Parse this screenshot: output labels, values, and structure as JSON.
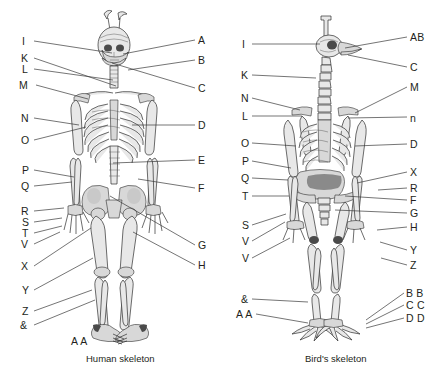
{
  "figure": {
    "title": "",
    "panels": [
      {
        "id": "human",
        "caption": "Human skeleton",
        "caption_x": 86,
        "caption_y": 353,
        "labels_left": [
          {
            "text": "I",
            "x": 22,
            "y": 36,
            "lx": 34,
            "ly": 41,
            "tx": 112,
            "ty": 53
          },
          {
            "text": "K",
            "x": 21,
            "y": 53,
            "lx": 34,
            "ly": 58,
            "tx": 116,
            "ty": 86
          },
          {
            "text": "L",
            "x": 22,
            "y": 64,
            "lx": 34,
            "ly": 69,
            "tx": 113,
            "ty": 80
          },
          {
            "text": "M",
            "x": 19,
            "y": 80,
            "lx": 36,
            "ly": 85,
            "tx": 88,
            "ty": 99
          },
          {
            "text": "N",
            "x": 21,
            "y": 113,
            "lx": 34,
            "ly": 118,
            "tx": 79,
            "ty": 125
          },
          {
            "text": "O",
            "x": 21,
            "y": 135,
            "lx": 34,
            "ly": 140,
            "tx": 86,
            "ty": 127
          },
          {
            "text": "P",
            "x": 22,
            "y": 165,
            "lx": 34,
            "ly": 170,
            "tx": 74,
            "ty": 177
          },
          {
            "text": "Q",
            "x": 21,
            "y": 181,
            "lx": 34,
            "ly": 186,
            "tx": 72,
            "ty": 182
          },
          {
            "text": "R",
            "x": 21,
            "y": 206,
            "lx": 34,
            "ly": 211,
            "tx": 64,
            "ty": 208
          },
          {
            "text": "S",
            "x": 22,
            "y": 217,
            "lx": 34,
            "ly": 222,
            "tx": 62,
            "ty": 218
          },
          {
            "text": "T",
            "x": 22,
            "y": 228,
            "lx": 34,
            "ly": 233,
            "tx": 62,
            "ty": 226
          },
          {
            "text": "V",
            "x": 21,
            "y": 239,
            "lx": 34,
            "ly": 244,
            "tx": 60,
            "ty": 232
          },
          {
            "text": "X",
            "x": 21,
            "y": 261,
            "lx": 34,
            "ly": 266,
            "tx": 91,
            "ty": 228
          },
          {
            "text": "Y",
            "x": 22,
            "y": 285,
            "lx": 34,
            "ly": 290,
            "tx": 93,
            "ty": 258
          },
          {
            "text": "Z",
            "x": 22,
            "y": 306,
            "lx": 34,
            "ly": 311,
            "tx": 92,
            "ty": 290
          },
          {
            "text": "&",
            "x": 20,
            "y": 320,
            "lx": 34,
            "ly": 325,
            "tx": 95,
            "ty": 300
          }
        ],
        "labels_right": [
          {
            "text": "A",
            "x": 198,
            "y": 35,
            "lx": 195,
            "ly": 40,
            "tx": 123,
            "ty": 54
          },
          {
            "text": "B",
            "x": 198,
            "y": 55,
            "lx": 195,
            "ly": 60,
            "tx": 128,
            "ty": 70
          },
          {
            "text": "C",
            "x": 198,
            "y": 83,
            "lx": 195,
            "ly": 88,
            "tx": 112,
            "ty": 63
          },
          {
            "text": "D",
            "x": 198,
            "y": 120,
            "lx": 195,
            "ly": 125,
            "tx": 132,
            "ty": 125
          },
          {
            "text": "E",
            "x": 198,
            "y": 155,
            "lx": 195,
            "ly": 160,
            "tx": 113,
            "ty": 163
          },
          {
            "text": "F",
            "x": 198,
            "y": 183,
            "lx": 195,
            "ly": 188,
            "tx": 138,
            "ty": 179
          },
          {
            "text": "G",
            "x": 198,
            "y": 240,
            "lx": 195,
            "ly": 245,
            "tx": 110,
            "ty": 196
          },
          {
            "text": "H",
            "x": 198,
            "y": 260,
            "lx": 195,
            "ly": 265,
            "tx": 133,
            "ty": 232
          }
        ],
        "labels_bottom": [
          {
            "text": "A A",
            "x": 71,
            "y": 336
          }
        ]
      },
      {
        "id": "bird",
        "caption": "Bird's skeleton",
        "caption_x": 305,
        "caption_y": 353,
        "labels_left": [
          {
            "text": "I",
            "x": 242,
            "y": 39,
            "lx": 252,
            "ly": 44,
            "tx": 320,
            "ty": 44
          },
          {
            "text": "K",
            "x": 241,
            "y": 70,
            "lx": 252,
            "ly": 75,
            "tx": 316,
            "ty": 78
          },
          {
            "text": "N",
            "x": 241,
            "y": 93,
            "lx": 252,
            "ly": 98,
            "tx": 300,
            "ty": 110
          },
          {
            "text": "L",
            "x": 242,
            "y": 111,
            "lx": 252,
            "ly": 116,
            "tx": 302,
            "ty": 116
          },
          {
            "text": "O",
            "x": 241,
            "y": 138,
            "lx": 252,
            "ly": 143,
            "tx": 296,
            "ty": 146
          },
          {
            "text": "P",
            "x": 242,
            "y": 156,
            "lx": 252,
            "ly": 161,
            "tx": 291,
            "ty": 168
          },
          {
            "text": "Q",
            "x": 241,
            "y": 173,
            "lx": 252,
            "ly": 178,
            "tx": 288,
            "ty": 180
          },
          {
            "text": "T",
            "x": 242,
            "y": 191,
            "lx": 252,
            "ly": 196,
            "tx": 289,
            "ty": 196
          },
          {
            "text": "S",
            "x": 242,
            "y": 220,
            "lx": 252,
            "ly": 225,
            "tx": 286,
            "ty": 214
          },
          {
            "text": "V",
            "x": 242,
            "y": 236,
            "lx": 252,
            "ly": 241,
            "tx": 285,
            "ty": 222
          },
          {
            "text": "V",
            "x": 242,
            "y": 253,
            "lx": 252,
            "ly": 258,
            "tx": 290,
            "ty": 238
          },
          {
            "text": "&",
            "x": 241,
            "y": 294,
            "lx": 252,
            "ly": 299,
            "tx": 308,
            "ty": 302
          },
          {
            "text": "A A",
            "x": 236,
            "y": 309,
            "lx": 256,
            "ly": 314,
            "tx": 308,
            "ty": 323
          }
        ],
        "labels_right": [
          {
            "text": "AB",
            "x": 410,
            "y": 32,
            "lx": 407,
            "ly": 37,
            "tx": 345,
            "ty": 48
          },
          {
            "text": "C",
            "x": 410,
            "y": 62,
            "lx": 407,
            "ly": 67,
            "tx": 348,
            "ty": 55
          },
          {
            "text": "M",
            "x": 410,
            "y": 82,
            "lx": 407,
            "ly": 87,
            "tx": 355,
            "ty": 113
          },
          {
            "text": "n",
            "x": 410,
            "y": 113,
            "lx": 407,
            "ly": 117,
            "tx": 348,
            "ty": 118
          },
          {
            "text": "D",
            "x": 410,
            "y": 139,
            "lx": 407,
            "ly": 144,
            "tx": 355,
            "ty": 146
          },
          {
            "text": "X",
            "x": 410,
            "y": 167,
            "lx": 407,
            "ly": 172,
            "tx": 357,
            "ty": 183
          },
          {
            "text": "R",
            "x": 410,
            "y": 183,
            "lx": 407,
            "ly": 188,
            "tx": 378,
            "ty": 190
          },
          {
            "text": "F",
            "x": 410,
            "y": 195,
            "lx": 407,
            "ly": 200,
            "tx": 345,
            "ty": 196
          },
          {
            "text": "G",
            "x": 410,
            "y": 208,
            "lx": 407,
            "ly": 213,
            "tx": 335,
            "ty": 210
          },
          {
            "text": "H",
            "x": 410,
            "y": 222,
            "lx": 407,
            "ly": 227,
            "tx": 377,
            "ty": 230
          },
          {
            "text": "Y",
            "x": 410,
            "y": 245,
            "lx": 407,
            "ly": 250,
            "tx": 380,
            "ty": 242
          },
          {
            "text": "Z",
            "x": 410,
            "y": 260,
            "lx": 407,
            "ly": 265,
            "tx": 381,
            "ty": 258
          },
          {
            "text": "B B",
            "x": 406,
            "y": 288,
            "lx": 404,
            "ly": 293,
            "tx": 366,
            "ty": 320
          },
          {
            "text": "C C",
            "x": 406,
            "y": 300,
            "lx": 404,
            "ly": 305,
            "tx": 366,
            "ty": 324
          },
          {
            "text": "D D",
            "x": 406,
            "y": 313,
            "lx": 404,
            "ly": 318,
            "tx": 366,
            "ty": 328
          }
        ],
        "labels_bottom": []
      }
    ]
  },
  "colors": {
    "background": "#ffffff",
    "text": "#231f20",
    "leader_line": "#3a3a3a",
    "bone_outline": "#2e2e2e",
    "bone_fill": "#e8e8e8"
  }
}
